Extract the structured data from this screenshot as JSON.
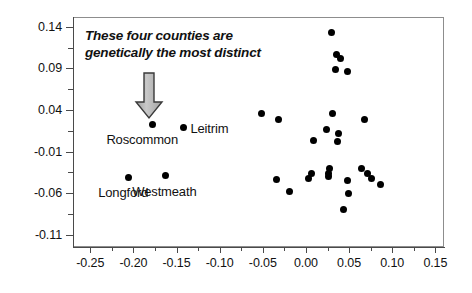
{
  "chart_data": {
    "type": "scatter",
    "title": "",
    "subtitle": "",
    "xlabel": "",
    "ylabel": "",
    "xlim": [
      -0.27,
      0.16
    ],
    "ylim": [
      -0.125,
      0.152
    ],
    "grid": false,
    "legend": "none",
    "x_ticks": [
      {
        "value": -0.25,
        "label": "-0.25"
      },
      {
        "value": -0.2,
        "label": "-0.20"
      },
      {
        "value": -0.15,
        "label": "-0.15"
      },
      {
        "value": -0.1,
        "label": "-0.10"
      },
      {
        "value": -0.05,
        "label": "-0.05"
      },
      {
        "value": 0.0,
        "label": "0.00"
      },
      {
        "value": 0.05,
        "label": "0.05"
      },
      {
        "value": 0.1,
        "label": "0.10"
      },
      {
        "value": 0.15,
        "label": "0.15"
      }
    ],
    "x_minor_ticks": [
      -0.225,
      -0.175,
      -0.125,
      -0.075,
      -0.025,
      0.025,
      0.075,
      0.125
    ],
    "y_ticks": [
      {
        "value": 0.14,
        "label": "0.14"
      },
      {
        "value": 0.09,
        "label": "0.09"
      },
      {
        "value": 0.04,
        "label": "0.04"
      },
      {
        "value": -0.01,
        "label": "-0.01"
      },
      {
        "value": -0.06,
        "label": "-0.06"
      },
      {
        "value": -0.11,
        "label": "-0.11"
      }
    ],
    "y_minor_ticks": [
      0.115,
      0.065,
      0.015,
      -0.035,
      -0.085
    ],
    "points": [
      {
        "x": -0.178,
        "y": 0.022,
        "label": "Roscommon",
        "label_dx": -46,
        "label_dy": 14
      },
      {
        "x": -0.142,
        "y": 0.019,
        "label": "Leitrim",
        "label_dx": 7,
        "label_dy": 1
      },
      {
        "x": -0.206,
        "y": -0.041,
        "label": "Longford",
        "label_dx": -30,
        "label_dy": 15
      },
      {
        "x": -0.163,
        "y": -0.039,
        "label": "Westmeath",
        "label_dx": -33,
        "label_dy": 15
      },
      {
        "x": 0.03,
        "y": 0.133
      },
      {
        "x": 0.035,
        "y": 0.107
      },
      {
        "x": 0.04,
        "y": 0.102
      },
      {
        "x": 0.034,
        "y": 0.089
      },
      {
        "x": 0.048,
        "y": 0.086
      },
      {
        "x": -0.051,
        "y": 0.036
      },
      {
        "x": 0.031,
        "y": 0.036
      },
      {
        "x": -0.032,
        "y": 0.028
      },
      {
        "x": 0.068,
        "y": 0.028
      },
      {
        "x": 0.024,
        "y": 0.016
      },
      {
        "x": 0.038,
        "y": 0.012
      },
      {
        "x": 0.009,
        "y": 0.003
      },
      {
        "x": 0.037,
        "y": 0.002
      },
      {
        "x": 0.027,
        "y": -0.031
      },
      {
        "x": 0.064,
        "y": -0.031
      },
      {
        "x": 0.006,
        "y": -0.036
      },
      {
        "x": 0.026,
        "y": -0.037
      },
      {
        "x": 0.071,
        "y": -0.036
      },
      {
        "x": 0.026,
        "y": -0.04
      },
      {
        "x": -0.034,
        "y": -0.044
      },
      {
        "x": 0.003,
        "y": -0.043
      },
      {
        "x": 0.076,
        "y": -0.043
      },
      {
        "x": 0.048,
        "y": -0.045
      },
      {
        "x": 0.086,
        "y": -0.05
      },
      {
        "x": -0.019,
        "y": -0.058
      },
      {
        "x": 0.049,
        "y": -0.06
      },
      {
        "x": 0.043,
        "y": -0.08
      }
    ],
    "annotations": [
      {
        "text": "These four counties are\ngenetically the most distinct",
        "style": "italic",
        "arrow": "down-arrow-gray"
      }
    ]
  }
}
